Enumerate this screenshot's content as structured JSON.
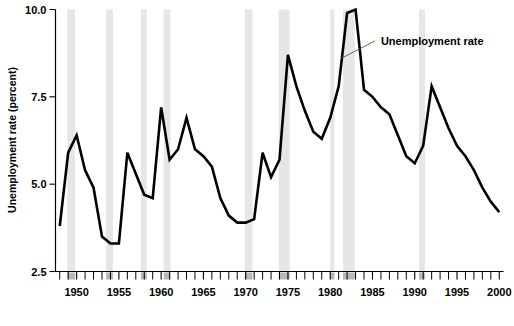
{
  "chart_data": {
    "type": "line",
    "title": "",
    "xlabel": "",
    "ylabel": "Unemployment rate (percent)",
    "ylim": [
      2.5,
      10.0
    ],
    "xlim": [
      1947.5,
      2000.5
    ],
    "yticks": [
      "2.5",
      "5.0",
      "7.5",
      "10.0"
    ],
    "ytick_values": [
      2.5,
      5.0,
      7.5,
      10.0
    ],
    "xticks": [
      "1950",
      "1955",
      "1960",
      "1965",
      "1970",
      "1975",
      "1980",
      "1985",
      "1990",
      "1995",
      "2000"
    ],
    "xtick_values": [
      1950,
      1955,
      1960,
      1965,
      1970,
      1975,
      1980,
      1985,
      1990,
      1995,
      2000
    ],
    "minor_xtick_interval": 1,
    "grid": false,
    "legend": "none",
    "series": [
      {
        "name": "Unemployment rate",
        "color": "#000000",
        "x": [
          1948,
          1949,
          1950,
          1951,
          1952,
          1953,
          1954,
          1955,
          1956,
          1957,
          1958,
          1959,
          1960,
          1961,
          1962,
          1963,
          1964,
          1965,
          1966,
          1967,
          1968,
          1969,
          1970,
          1971,
          1972,
          1973,
          1974,
          1975,
          1976,
          1977,
          1978,
          1979,
          1980,
          1981,
          1982,
          1983,
          1984,
          1985,
          1986,
          1987,
          1988,
          1989,
          1990,
          1991,
          1992,
          1993,
          1994,
          1995,
          1996,
          1997,
          1998,
          1999,
          2000
        ],
        "values": [
          3.8,
          5.9,
          6.4,
          5.4,
          4.9,
          3.5,
          3.3,
          3.3,
          5.9,
          5.3,
          4.7,
          4.6,
          7.2,
          5.7,
          6.0,
          6.9,
          6.0,
          5.8,
          5.5,
          4.6,
          4.1,
          3.9,
          3.9,
          4.0,
          5.9,
          5.2,
          5.7,
          8.7,
          7.8,
          7.1,
          6.5,
          6.3,
          6.9,
          7.8,
          9.9,
          10.0,
          7.7,
          7.5,
          7.2,
          7.0,
          6.4,
          5.8,
          5.6,
          6.1,
          7.8,
          7.2,
          6.6,
          6.1,
          5.8,
          5.4,
          4.9,
          4.5,
          4.2
        ]
      }
    ],
    "annotations": [
      {
        "text": "Unemployment rate",
        "target_x": 1981.3,
        "target_y": 8.6,
        "label_x": 1986.0,
        "label_y": 9.1
      }
    ],
    "shaded_regions": {
      "name": "recession-bands",
      "color": "#e6e6e6",
      "bands": [
        {
          "start": 1948.9,
          "end": 1949.8
        },
        {
          "start": 1953.5,
          "end": 1954.3
        },
        {
          "start": 1957.6,
          "end": 1958.3
        },
        {
          "start": 1960.3,
          "end": 1961.1
        },
        {
          "start": 1969.9,
          "end": 1970.8
        },
        {
          "start": 1973.9,
          "end": 1975.2
        },
        {
          "start": 1980.0,
          "end": 1980.5
        },
        {
          "start": 1981.5,
          "end": 1982.9
        },
        {
          "start": 1990.5,
          "end": 1991.2
        }
      ]
    }
  },
  "footer": {
    "source_fragment": ""
  }
}
